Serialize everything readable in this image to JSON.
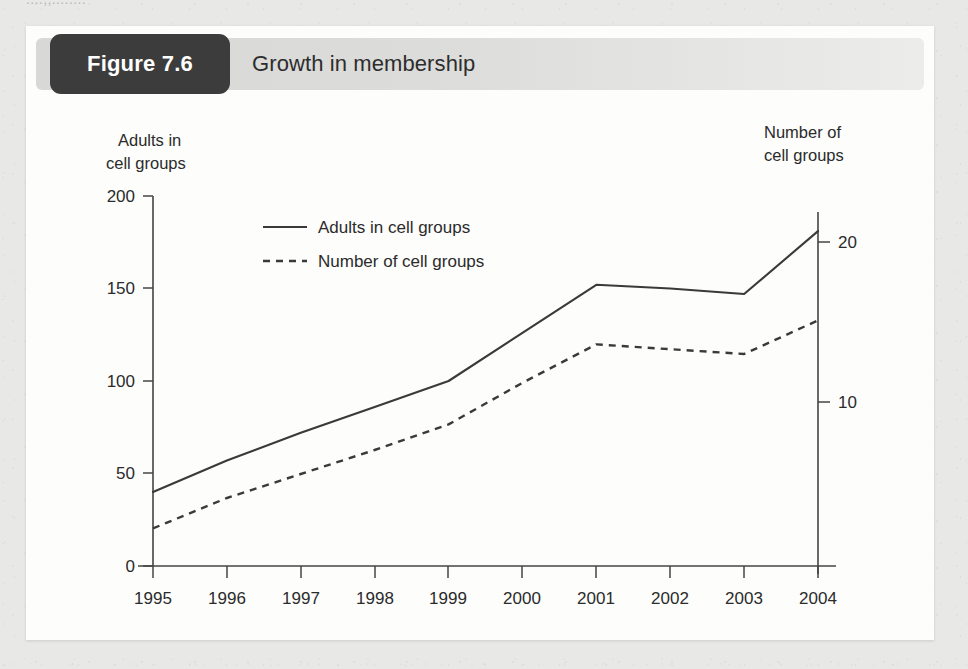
{
  "page": {
    "background_color": "#e8e8e6",
    "card_color": "#fdfdfc",
    "top_ghost_text": "....,,........"
  },
  "header": {
    "figure_label": "Figure 7.6",
    "title": "Growth in membership",
    "badge_color": "#3c3c3c",
    "badge_text_color": "#ffffff",
    "bar_color_left": "#d8d8d6",
    "bar_color_right": "#ececeb"
  },
  "chart_data": {
    "type": "line",
    "title": "Growth in membership",
    "xlabel": "",
    "ylabel": "Adults in cell groups",
    "y2label": "Number of cell groups",
    "left_axis_caption": [
      "Adults in",
      "cell groups"
    ],
    "right_axis_caption": [
      "Number of",
      "cell groups"
    ],
    "categories": [
      "1995",
      "1996",
      "1997",
      "1998",
      "1999",
      "2000",
      "2001",
      "2002",
      "2003",
      "2004"
    ],
    "x": [
      1995,
      1996,
      1997,
      1998,
      1999,
      2000,
      2001,
      2002,
      2003,
      2004
    ],
    "ylim": [
      0,
      200
    ],
    "yticks": [
      0,
      50,
      100,
      150,
      200
    ],
    "yticklabels": [
      "0",
      "50",
      "100",
      "150",
      "200"
    ],
    "y2lim": [
      0,
      22.75
    ],
    "y2ticks": [
      10,
      20
    ],
    "y2ticklabels": [
      "10",
      "20"
    ],
    "grid": false,
    "legend_position": "upper-left-inside",
    "line_color": "#3a3a3a",
    "series": [
      {
        "name": "Adults in cell groups",
        "axis": "left",
        "style": "solid",
        "values": [
          40,
          57,
          72,
          86,
          100,
          126,
          152,
          150,
          147,
          181
        ]
      },
      {
        "name": "Number of cell groups",
        "axis": "right",
        "style": "dashed",
        "values": [
          2.1,
          4.0,
          5.5,
          7.0,
          8.6,
          11.2,
          13.6,
          13.3,
          13.0,
          15.1
        ]
      }
    ],
    "legend": [
      {
        "label": "Adults in cell groups",
        "style": "solid"
      },
      {
        "label": "Number of cell groups",
        "style": "dashed"
      }
    ]
  }
}
